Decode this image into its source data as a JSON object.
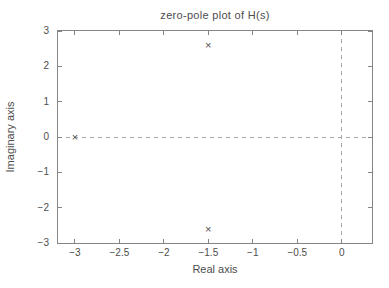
{
  "figure": {
    "title": "zero-pole plot of H(s)",
    "xlabel": "Real axis",
    "ylabel": "Imaginary axis"
  },
  "colors": {
    "background": "#ffffff",
    "axis": "#858585",
    "text": "#4d4d4d",
    "marker": "#4f4f4f",
    "dashed_line": "#a8a8a8"
  },
  "chart_data": {
    "type": "scatter",
    "subtype": "pole-zero-plot",
    "title": "zero-pole plot of H(s)",
    "xlabel": "Real axis",
    "ylabel": "Imaginary axis",
    "xlim": [
      -3.19,
      0.34
    ],
    "ylim": [
      -3,
      3
    ],
    "grid": false,
    "box": true,
    "xticks": [
      {
        "value": -3,
        "label": "−3"
      },
      {
        "value": -2.5,
        "label": "−2.5"
      },
      {
        "value": -2,
        "label": "−2"
      },
      {
        "value": -1.5,
        "label": "−1.5"
      },
      {
        "value": -1,
        "label": "−1"
      },
      {
        "value": -0.5,
        "label": "−0.5"
      },
      {
        "value": 0,
        "label": "0"
      }
    ],
    "yticks": [
      {
        "value": -3,
        "label": "−3"
      },
      {
        "value": -2,
        "label": "−2"
      },
      {
        "value": -1,
        "label": "−1"
      },
      {
        "value": 0,
        "label": "0"
      },
      {
        "value": 1,
        "label": "1"
      },
      {
        "value": 2,
        "label": "2"
      },
      {
        "value": 3,
        "label": "3"
      }
    ],
    "reference_lines": [
      {
        "axis": "horizontal",
        "value": 0,
        "style": "dashed"
      },
      {
        "axis": "vertical",
        "value": 0,
        "style": "dashed"
      }
    ],
    "series": [
      {
        "name": "poles",
        "marker": "×",
        "points": [
          {
            "re": -3,
            "im": 0
          },
          {
            "re": -1.5,
            "im": 2.6
          },
          {
            "re": -1.5,
            "im": -2.6
          }
        ]
      },
      {
        "name": "zeros",
        "marker": "○",
        "points": []
      }
    ]
  }
}
